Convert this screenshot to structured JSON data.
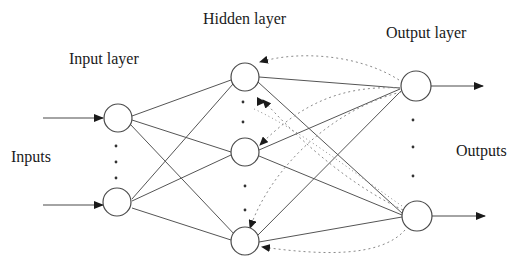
{
  "labels": {
    "input_layer": "Input layer",
    "hidden_layer": "Hidden layer",
    "output_layer": "Output layer",
    "inputs": "Inputs",
    "outputs": "Outputs"
  },
  "colors": {
    "stroke": "#4a4a4a",
    "dotted": "#8a8a8a",
    "text": "#1a1a1a",
    "background": "#ffffff"
  },
  "layers": {
    "input": {
      "nodes_shown": 2,
      "ellipsis": true
    },
    "hidden": {
      "nodes_shown": 3,
      "ellipsis": true
    },
    "output": {
      "nodes_shown": 2,
      "ellipsis": true
    }
  },
  "connections": {
    "input_to_hidden": "fully-connected",
    "hidden_to_output": "fully-connected",
    "feedback": "dotted arrows from output nodes back to hidden nodes"
  }
}
